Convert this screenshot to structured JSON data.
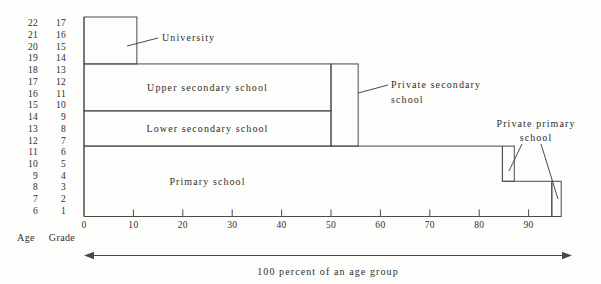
{
  "figure": {
    "colors": {
      "background": "#fdfdfb",
      "line": "#4a4a4a",
      "text": "#2e2e2e"
    }
  },
  "left_axis": {
    "age_header": "Age",
    "grade_header": "Grade",
    "ages": [
      "22",
      "21",
      "20",
      "19",
      "18",
      "17",
      "16",
      "15",
      "14",
      "13",
      "12",
      "11",
      "10",
      "9",
      "8",
      "7",
      "6"
    ],
    "grades": [
      "17",
      "16",
      "15",
      "14",
      "13",
      "12",
      "11",
      "10",
      "9",
      "8",
      "7",
      "6",
      "5",
      "4",
      "3",
      "2",
      "1"
    ]
  },
  "x_axis": {
    "tick_labels": [
      "0",
      "10",
      "20",
      "30",
      "40",
      "50",
      "60",
      "70",
      "80",
      "90"
    ]
  },
  "bottom_arrow": {
    "label": "100 percent of an age group"
  },
  "chart_data": {
    "type": "bar",
    "title": "",
    "xlabel": "100 percent of an age group",
    "x_ticks": [
      0,
      10,
      20,
      30,
      40,
      50,
      60,
      70,
      80,
      90
    ],
    "x_max": 96.6,
    "grade_rows": 17,
    "boxes": [
      {
        "id": "university",
        "label": "University",
        "percent": [
          0,
          10.7
        ],
        "grades": [
          14,
          17
        ],
        "label_style": "callout"
      },
      {
        "id": "upper-secondary",
        "label": "Upper secondary school",
        "percent": [
          0,
          50
        ],
        "grades": [
          10,
          13
        ],
        "label_style": "inside"
      },
      {
        "id": "lower-secondary",
        "label": "Lower secondary school",
        "percent": [
          0,
          50
        ],
        "grades": [
          7,
          9
        ],
        "label_style": "inside"
      },
      {
        "id": "private-secondary",
        "label": "Private secondary school",
        "label_lines": [
          "Private secondary",
          "school"
        ],
        "percent": [
          50,
          55.5
        ],
        "grades": [
          7,
          13
        ],
        "label_style": "callout"
      },
      {
        "id": "primary",
        "label": "Primary school",
        "percent_grades_4_6": [
          0,
          84.7
        ],
        "percent_grades_1_3": [
          0,
          94.7
        ],
        "grades": [
          1,
          6
        ],
        "step_between_grades": [
          3,
          4
        ],
        "label_style": "inside"
      },
      {
        "id": "private-primary-upper",
        "label": "Private primary school",
        "label_lines": [
          "Private primary",
          "school"
        ],
        "percent": [
          84.7,
          87.1
        ],
        "grades": [
          4,
          6
        ],
        "label_style": "callout-shared"
      },
      {
        "id": "private-primary-lower",
        "label": "Private primary school",
        "percent": [
          94.7,
          96.6
        ],
        "grades": [
          1,
          3
        ],
        "label_style": "callout-shared"
      }
    ]
  }
}
